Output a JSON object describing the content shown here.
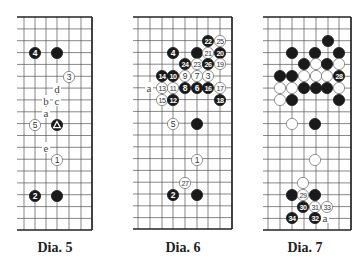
{
  "colors": {
    "line": "#555555",
    "border": "#222222",
    "black_stone": "#1a1a1a",
    "white_stone": "#ffffff",
    "stone_outline": "#777777",
    "label": "#444444"
  },
  "diagrams": [
    {
      "caption": "Dia. 5",
      "caption_x": 15,
      "caption_y": 240,
      "x_left": 17,
      "x_right": 92,
      "cols": [
        24,
        35,
        46,
        57,
        69,
        81,
        92
      ],
      "y_top": 17,
      "y_bottom": 230,
      "row_step": 11.85,
      "stones": [
        {
          "x": 35,
          "y": 53,
          "color": "black",
          "label": "4"
        },
        {
          "x": 57,
          "y": 53,
          "color": "black",
          "label": ""
        },
        {
          "x": 69,
          "y": 77,
          "color": "white",
          "label": "3"
        },
        {
          "x": 35,
          "y": 125,
          "color": "white",
          "label": "5"
        },
        {
          "x": 57,
          "y": 125,
          "color": "black",
          "label": "△"
        },
        {
          "x": 57,
          "y": 160,
          "color": "white",
          "label": "1"
        },
        {
          "x": 35,
          "y": 196,
          "color": "black",
          "label": "2"
        },
        {
          "x": 57,
          "y": 196,
          "color": "black",
          "label": ""
        }
      ],
      "marks": [
        {
          "x": 57,
          "y": 89,
          "text": "d"
        },
        {
          "x": 46,
          "y": 101,
          "text": "b"
        },
        {
          "x": 57,
          "y": 101,
          "text": "c"
        },
        {
          "x": 46,
          "y": 113,
          "text": "a"
        },
        {
          "x": 46,
          "y": 148,
          "text": "e"
        }
      ]
    },
    {
      "caption": "Dia. 6",
      "caption_x": 143,
      "caption_y": 240,
      "x_left": 133,
      "x_right": 232,
      "cols": [
        138,
        150,
        162,
        173,
        185,
        197,
        208,
        220,
        232
      ],
      "y_top": 17,
      "y_bottom": 229,
      "row_step": 11.8,
      "stones": [
        {
          "x": 208,
          "y": 41,
          "color": "black",
          "label": "22"
        },
        {
          "x": 220,
          "y": 41,
          "color": "white",
          "label": "25"
        },
        {
          "x": 173,
          "y": 53,
          "color": "black",
          "label": "4"
        },
        {
          "x": 197,
          "y": 53,
          "color": "black",
          "label": ""
        },
        {
          "x": 208,
          "y": 53,
          "color": "white",
          "label": "21"
        },
        {
          "x": 220,
          "y": 53,
          "color": "black",
          "label": "20"
        },
        {
          "x": 185,
          "y": 64,
          "color": "black",
          "label": "24"
        },
        {
          "x": 197,
          "y": 64,
          "color": "white",
          "label": "23"
        },
        {
          "x": 208,
          "y": 64,
          "color": "black",
          "label": "26"
        },
        {
          "x": 220,
          "y": 64,
          "color": "white",
          "label": "19"
        },
        {
          "x": 162,
          "y": 76,
          "color": "black",
          "label": "14"
        },
        {
          "x": 173,
          "y": 76,
          "color": "black",
          "label": "10"
        },
        {
          "x": 185,
          "y": 76,
          "color": "white",
          "label": "9"
        },
        {
          "x": 197,
          "y": 76,
          "color": "white",
          "label": "7"
        },
        {
          "x": 208,
          "y": 76,
          "color": "white",
          "label": "3"
        },
        {
          "x": 162,
          "y": 88,
          "color": "white",
          "label": "13"
        },
        {
          "x": 173,
          "y": 88,
          "color": "white",
          "label": "11"
        },
        {
          "x": 185,
          "y": 88,
          "color": "black",
          "label": "8"
        },
        {
          "x": 197,
          "y": 88,
          "color": "black",
          "label": "6"
        },
        {
          "x": 208,
          "y": 88,
          "color": "black",
          "label": "16"
        },
        {
          "x": 220,
          "y": 88,
          "color": "white",
          "label": "17"
        },
        {
          "x": 162,
          "y": 100,
          "color": "white",
          "label": "15"
        },
        {
          "x": 173,
          "y": 100,
          "color": "black",
          "label": "12"
        },
        {
          "x": 220,
          "y": 100,
          "color": "black",
          "label": "18"
        },
        {
          "x": 173,
          "y": 124,
          "color": "white",
          "label": "5"
        },
        {
          "x": 197,
          "y": 124,
          "color": "black",
          "label": ""
        },
        {
          "x": 197,
          "y": 160,
          "color": "white",
          "label": "1"
        },
        {
          "x": 185,
          "y": 183,
          "color": "white",
          "label": "27"
        },
        {
          "x": 173,
          "y": 195,
          "color": "black",
          "label": "2"
        },
        {
          "x": 197,
          "y": 195,
          "color": "black",
          "label": ""
        }
      ],
      "marks": [
        {
          "x": 149,
          "y": 88,
          "text": "a"
        }
      ]
    },
    {
      "caption": "Dia. 7",
      "caption_x": 265,
      "caption_y": 240,
      "x_left": 263,
      "x_right": 351,
      "cols": [
        268,
        280,
        292,
        304,
        316,
        328,
        339,
        351
      ],
      "y_top": 17,
      "y_bottom": 230,
      "row_step": 11.85,
      "stones": [
        {
          "x": 328,
          "y": 41,
          "color": "black",
          "label": ""
        },
        {
          "x": 292,
          "y": 53,
          "color": "black",
          "label": ""
        },
        {
          "x": 315,
          "y": 53,
          "color": "black",
          "label": ""
        },
        {
          "x": 339,
          "y": 53,
          "color": "black",
          "label": ""
        },
        {
          "x": 304,
          "y": 64,
          "color": "black",
          "label": ""
        },
        {
          "x": 316,
          "y": 64,
          "color": "white",
          "label": ""
        },
        {
          "x": 327,
          "y": 64,
          "color": "black",
          "label": ""
        },
        {
          "x": 339,
          "y": 64,
          "color": "white",
          "label": ""
        },
        {
          "x": 280,
          "y": 76,
          "color": "black",
          "label": ""
        },
        {
          "x": 292,
          "y": 76,
          "color": "black",
          "label": ""
        },
        {
          "x": 304,
          "y": 76,
          "color": "white",
          "label": ""
        },
        {
          "x": 316,
          "y": 76,
          "color": "white",
          "label": ""
        },
        {
          "x": 327,
          "y": 76,
          "color": "white",
          "label": ""
        },
        {
          "x": 339,
          "y": 76,
          "color": "black",
          "label": "28"
        },
        {
          "x": 280,
          "y": 88,
          "color": "white",
          "label": ""
        },
        {
          "x": 292,
          "y": 88,
          "color": "white",
          "label": ""
        },
        {
          "x": 304,
          "y": 88,
          "color": "black",
          "label": ""
        },
        {
          "x": 316,
          "y": 88,
          "color": "black",
          "label": ""
        },
        {
          "x": 327,
          "y": 88,
          "color": "black",
          "label": ""
        },
        {
          "x": 339,
          "y": 88,
          "color": "white",
          "label": ""
        },
        {
          "x": 280,
          "y": 100,
          "color": "white",
          "label": ""
        },
        {
          "x": 292,
          "y": 100,
          "color": "black",
          "label": ""
        },
        {
          "x": 339,
          "y": 100,
          "color": "black",
          "label": ""
        },
        {
          "x": 292,
          "y": 124,
          "color": "white",
          "label": ""
        },
        {
          "x": 315,
          "y": 124,
          "color": "black",
          "label": ""
        },
        {
          "x": 315,
          "y": 160,
          "color": "white",
          "label": ""
        },
        {
          "x": 303,
          "y": 183,
          "color": "white",
          "label": ""
        },
        {
          "x": 292,
          "y": 195,
          "color": "black",
          "label": ""
        },
        {
          "x": 303,
          "y": 195,
          "color": "white",
          "label": "29"
        },
        {
          "x": 315,
          "y": 195,
          "color": "black",
          "label": ""
        },
        {
          "x": 303,
          "y": 207,
          "color": "black",
          "label": "30"
        },
        {
          "x": 315,
          "y": 207,
          "color": "white",
          "label": "31"
        },
        {
          "x": 327,
          "y": 207,
          "color": "white",
          "label": "33"
        },
        {
          "x": 292,
          "y": 218,
          "color": "black",
          "label": "34"
        },
        {
          "x": 315,
          "y": 218,
          "color": "black",
          "label": "32"
        }
      ],
      "marks": [
        {
          "x": 325,
          "y": 218,
          "text": "a"
        }
      ]
    }
  ]
}
